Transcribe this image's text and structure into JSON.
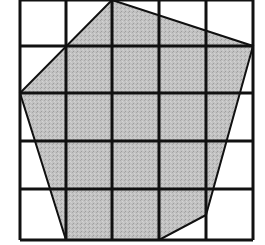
{
  "diagram": {
    "type": "grid-polygon",
    "grid": {
      "columns": 5,
      "rows": 5,
      "x_lines": [
        20,
        66,
        112,
        159,
        206,
        253
      ],
      "y_lines": [
        0,
        46,
        93,
        141,
        189,
        240
      ],
      "line_color": "#111111"
    },
    "polygon": {
      "vertices": [
        [
          112,
          0
        ],
        [
          253,
          46
        ],
        [
          206,
          215
        ],
        [
          159,
          240
        ],
        [
          66,
          240
        ],
        [
          20,
          93
        ]
      ],
      "fill_color": "#bdbdbd",
      "stroke_color": "#111111"
    }
  }
}
